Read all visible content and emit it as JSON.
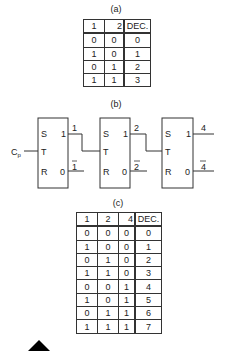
{
  "captions": {
    "a": "(a)",
    "b": "(b)",
    "c": "(c)"
  },
  "table_a": {
    "headers": [
      "1",
      "2",
      "DEC."
    ],
    "rows": [
      [
        "0",
        "0",
        "0"
      ],
      [
        "1",
        "0",
        "1"
      ],
      [
        "0",
        "1",
        "2"
      ],
      [
        "1",
        "1",
        "3"
      ]
    ]
  },
  "diagram_b": {
    "clock_label": "C",
    "clock_sub": "p",
    "flipflops": [
      {
        "s": "S",
        "t": "T",
        "r": "R",
        "q": "1",
        "qbar": "0",
        "out_label": "1",
        "out_bar_label": "1"
      },
      {
        "s": "S",
        "t": "T",
        "r": "R",
        "q": "1",
        "qbar": "0",
        "out_label": "2",
        "out_bar_label": "2"
      },
      {
        "s": "S",
        "t": "T",
        "r": "R",
        "q": "1",
        "qbar": "0",
        "out_label": "4",
        "out_bar_label": "4"
      }
    ]
  },
  "table_c": {
    "headers": [
      "1",
      "2",
      "4",
      "DEC."
    ],
    "rows": [
      [
        "0",
        "0",
        "0",
        "0"
      ],
      [
        "1",
        "0",
        "0",
        "1"
      ],
      [
        "0",
        "1",
        "0",
        "2"
      ],
      [
        "1",
        "1",
        "0",
        "3"
      ],
      [
        "0",
        "0",
        "1",
        "4"
      ],
      [
        "1",
        "0",
        "1",
        "5"
      ],
      [
        "0",
        "1",
        "1",
        "6"
      ],
      [
        "1",
        "1",
        "1",
        "7"
      ]
    ]
  }
}
